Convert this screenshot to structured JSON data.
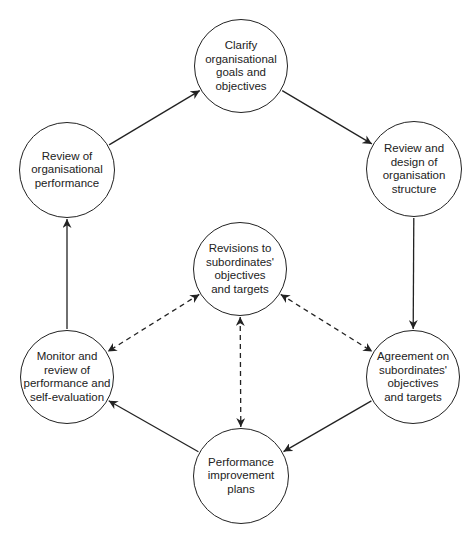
{
  "diagram": {
    "type": "cycle-flowchart",
    "colors": {
      "stroke": "#222222",
      "text": "#222222",
      "background": "#ffffff"
    },
    "nodes": [
      {
        "id": "clarify",
        "label": "Clarify\norganisational\ngoals and\nobjectives",
        "cx": 241,
        "cy": 66,
        "r": 47
      },
      {
        "id": "review-design",
        "label": "Review and\ndesign of\norganisation\nstructure",
        "cx": 414,
        "cy": 169,
        "r": 48
      },
      {
        "id": "agreement",
        "label": "Agreement on\nsubordinates'\nobjectives\nand targets",
        "cx": 413,
        "cy": 377,
        "r": 47
      },
      {
        "id": "performance-improvement",
        "label": "Performance\nimprovement\nplans",
        "cx": 241,
        "cy": 476,
        "r": 48
      },
      {
        "id": "monitor",
        "label": "Monitor and\nreview of\nperformance and\nself-evaluation",
        "cx": 67,
        "cy": 377,
        "r": 47
      },
      {
        "id": "review-org-performance",
        "label": "Review of\norganisational\nperformance",
        "cx": 67,
        "cy": 170,
        "r": 48
      },
      {
        "id": "revisions",
        "label": "Revisions to\nsubordinates'\nobjectives\nand targets",
        "cx": 240,
        "cy": 269,
        "r": 47
      }
    ],
    "edges": [
      {
        "from": "clarify",
        "to": "review-design",
        "style": "solid",
        "direction": "forward"
      },
      {
        "from": "review-design",
        "to": "agreement",
        "style": "solid",
        "direction": "forward"
      },
      {
        "from": "agreement",
        "to": "performance-improvement",
        "style": "solid",
        "direction": "forward"
      },
      {
        "from": "performance-improvement",
        "to": "monitor",
        "style": "solid",
        "direction": "forward"
      },
      {
        "from": "monitor",
        "to": "review-org-performance",
        "style": "solid",
        "direction": "forward"
      },
      {
        "from": "review-org-performance",
        "to": "clarify",
        "style": "solid",
        "direction": "forward"
      },
      {
        "from": "revisions",
        "to": "monitor",
        "style": "dashed",
        "direction": "both"
      },
      {
        "from": "revisions",
        "to": "agreement",
        "style": "dashed",
        "direction": "both"
      },
      {
        "from": "revisions",
        "to": "performance-improvement",
        "style": "dashed",
        "direction": "both"
      }
    ]
  }
}
